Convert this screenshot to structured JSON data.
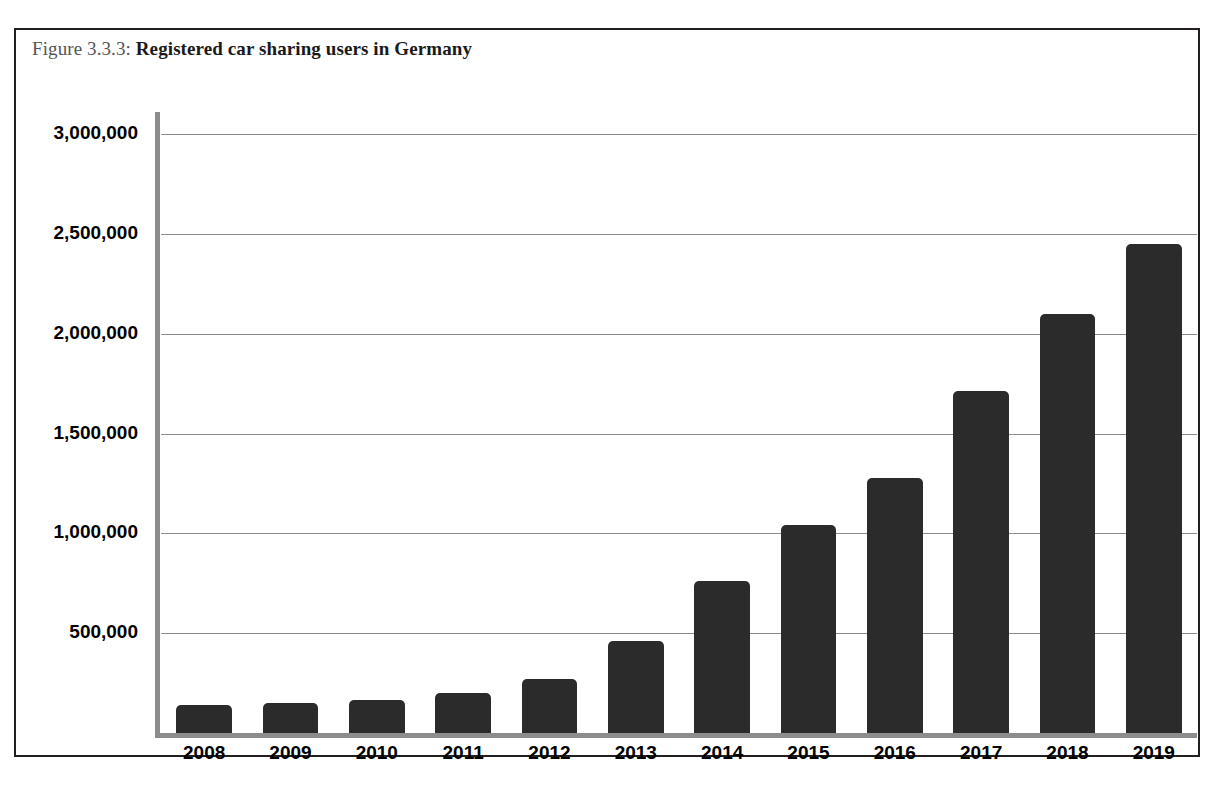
{
  "figure": {
    "caption_label": "Figure 3.3.3:",
    "caption_title": "Registered car sharing users in Germany",
    "border_color": "#231f20",
    "background_color": "#ffffff"
  },
  "chart_data": {
    "type": "bar",
    "title": "Registered car sharing users in Germany",
    "xlabel": "",
    "ylabel": "",
    "categories": [
      "2008",
      "2009",
      "2010",
      "2011",
      "2012",
      "2013",
      "2014",
      "2015",
      "2016",
      "2017",
      "2018",
      "2019"
    ],
    "values": [
      140000,
      150000,
      165000,
      200000,
      270000,
      460000,
      760000,
      1040000,
      1275000,
      1715000,
      2100000,
      2450000
    ],
    "ylim": [
      0,
      3000000
    ],
    "ytick_values": [
      3000000,
      2500000,
      2000000,
      1500000,
      1000000,
      500000
    ],
    "ytick_labels": [
      "3,000,000",
      "2,500,000",
      "2,000,000",
      "1,500,000",
      "1,000,000",
      "500,000"
    ],
    "grid": true,
    "gridline_color": "#8a8a8a",
    "axis_color": "#8c8c8c",
    "bar_color": "#2b2b2b",
    "legend": null,
    "legend_position": "none"
  }
}
